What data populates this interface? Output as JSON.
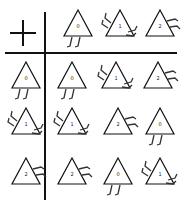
{
  "table": {
    "operator": "+",
    "header_row": [
      "0",
      "1",
      "2"
    ],
    "header_col": [
      "0",
      "1",
      "2"
    ],
    "cells": [
      [
        "0",
        "1",
        "2"
      ],
      [
        "1",
        "2",
        "0"
      ],
      [
        "2",
        "0",
        "1"
      ]
    ]
  },
  "legend": {
    "0": "legs-bottom",
    "1": "legs-left-and-right-side",
    "2": "legs-right-side"
  }
}
